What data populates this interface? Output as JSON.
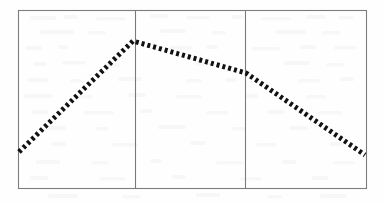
{
  "figure": {
    "background_color": "#fefefe",
    "frame_color": "#7d7d7d",
    "divider_color": "#7a7a7a",
    "series_color": "#121212",
    "caption": ""
  },
  "frame": {
    "left": 18,
    "top": 10,
    "right": 366,
    "bottom": 188
  },
  "dividers": [
    135,
    245
  ],
  "chart_data": {
    "type": "line",
    "title": "",
    "subtitle": "",
    "xlabel": "",
    "ylabel": "",
    "xlim": [
      0,
      3
    ],
    "ylim": [
      0,
      1
    ],
    "grid": false,
    "legend": null,
    "legend_position": "none",
    "line_style": "dashed",
    "line_width": 5,
    "dash_pattern": "3 3",
    "marker": "none",
    "x_tick_labels": [],
    "y_tick_labels": [],
    "annotations": [],
    "series": [
      {
        "name": "series-1",
        "color": "#121212",
        "x": [
          0.0093,
          0.3362,
          0.6552,
          1.0
        ],
        "y": [
          0.2022,
          0.8258,
          0.6461,
          0.1854
        ],
        "points_px": [
          {
            "x": 19,
            "y": 152
          },
          {
            "x": 133,
            "y": 41
          },
          {
            "x": 246,
            "y": 73
          },
          {
            "x": 365,
            "y": 155
          }
        ]
      }
    ]
  }
}
